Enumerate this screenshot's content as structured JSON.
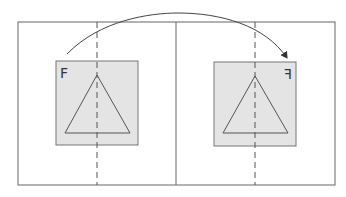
{
  "diagram": {
    "left_panel": {
      "label": "F",
      "shape": "triangle"
    },
    "right_panel": {
      "label": "F",
      "label_mirrored": true,
      "shape": "triangle"
    },
    "arrow": {
      "from": "left_panel",
      "to": "right_panel",
      "style": "curved"
    },
    "colors": {
      "stroke": "#555555",
      "fill": "#e4e4e4",
      "background": "#ffffff"
    }
  }
}
